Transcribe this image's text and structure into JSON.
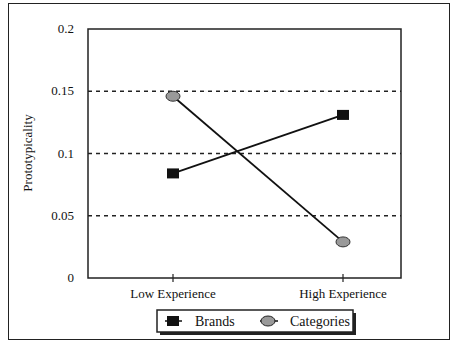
{
  "chart_data": {
    "type": "line",
    "title": "",
    "xlabel": "",
    "ylabel": "Prototypicality",
    "categories": [
      "Low Experience",
      "High Experience"
    ],
    "ylim": [
      0,
      0.2
    ],
    "yticks": [
      "0",
      "0.05",
      "0.1",
      "0.15",
      "0.2"
    ],
    "ytick_values": [
      0,
      0.05,
      0.1,
      0.15,
      0.2
    ],
    "grid": "horizontal dashed at 0.05, 0.1, 0.15",
    "legend_position": "bottom-center",
    "series": [
      {
        "name": "Brands",
        "marker": "square",
        "color": "#111111",
        "values": [
          0.084,
          0.131
        ]
      },
      {
        "name": "Categories",
        "marker": "circle",
        "color": "#999999",
        "values": [
          0.146,
          0.029
        ]
      }
    ]
  }
}
